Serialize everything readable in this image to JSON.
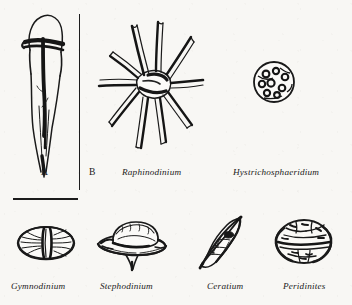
{
  "figure": {
    "background_color": "#f8f7f4",
    "ink_color": "#1a1a1a"
  },
  "rules": {
    "vertical_divider_name": "panel-divider",
    "scale_bar_name": "scale-bar",
    "bottom_rule_name": "row-separator-rule"
  },
  "top_row": {
    "items": [
      {
        "label": "A",
        "label_style": "plain",
        "icon": "elongated-dinoflagellate-cyst-specimen-a",
        "shape_note": "slender elongate cyst, rounded apex, dark girdle band, long tapering antapical horn"
      },
      {
        "label": "B",
        "label_style": "plain",
        "icon": "panel-b-marker",
        "shape_note": "panel label for the spiny forms at right"
      },
      {
        "label": "Raphinodinium",
        "label_style": "italic",
        "icon": "stellate-spiny-cyst-raphinodinium",
        "shape_note": "star-shaped central body with about ten long tapering solid spines"
      },
      {
        "label": "Hystrichosphaeridium",
        "label_style": "italic",
        "icon": "trumpet-process-cyst-hystrichosphaeridium",
        "shape_note": "spherical central body bearing many short trumpet-tipped processes"
      }
    ]
  },
  "bottom_row": {
    "items": [
      {
        "label": "Gymnodinium",
        "label_style": "italic",
        "icon": "oval-girdled-theca-gymnodinium",
        "shape_note": "rounded oval cell divided by a deep median girdle"
      },
      {
        "label": "Stephodinium",
        "label_style": "italic",
        "icon": "domed-flanged-cyst-stephodinium",
        "shape_note": "domed body set within a broad horizontal flange with a short antapical point"
      },
      {
        "label": "Ceratium",
        "label_style": "italic",
        "icon": "fusiform-horned-theca-ceratium",
        "shape_note": "spindle-shaped cell with pointed apical and antapical horns"
      },
      {
        "label": "Peridinites",
        "label_style": "italic",
        "icon": "circular-plated-cyst-peridinites",
        "shape_note": "subcircular cell with dark plate sutures and granular ornament"
      }
    ]
  }
}
